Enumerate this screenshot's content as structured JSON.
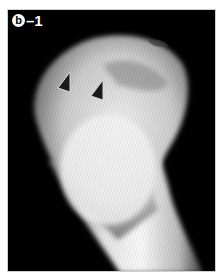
{
  "figure": {
    "panel_label_letter": "b",
    "panel_label_suffix": "–1",
    "arrowheads": [
      {
        "x": 62,
        "y": 96
      },
      {
        "x": 95,
        "y": 103
      }
    ],
    "colors": {
      "background": "#000000",
      "page": "#ffffff",
      "arrowhead_fill": "#1a1a1a",
      "arrowhead_stroke": "#d8d8d8"
    }
  }
}
